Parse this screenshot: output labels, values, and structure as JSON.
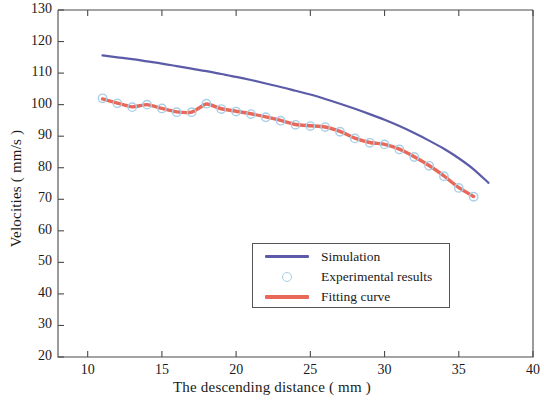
{
  "chart_data": {
    "type": "line",
    "title": "",
    "xlabel": "The descending distance ( mm )",
    "ylabel": "Velocities ( mm/s )",
    "xlim": [
      8,
      40
    ],
    "ylim": [
      20,
      130
    ],
    "xticks": [
      10,
      15,
      20,
      25,
      30,
      35,
      40
    ],
    "yticks": [
      20,
      30,
      40,
      50,
      60,
      70,
      80,
      90,
      100,
      110,
      120,
      130
    ],
    "grid": false,
    "legend_position": "lower-center-right",
    "series": [
      {
        "name": "Simulation",
        "style": "line",
        "color": "#5b5ba8",
        "x": [
          11.0,
          12.0,
          13.0,
          14.0,
          15.0,
          16.0,
          17.0,
          18.0,
          19.0,
          20.0,
          21.0,
          22.0,
          23.0,
          24.0,
          25.0,
          26.0,
          27.0,
          28.0,
          29.0,
          30.0,
          31.0,
          32.0,
          33.0,
          34.0,
          35.0,
          36.0,
          37.0
        ],
        "y": [
          115.6,
          115.0,
          114.4,
          113.7,
          113.0,
          112.2,
          111.4,
          110.6,
          109.7,
          108.8,
          107.8,
          106.7,
          105.6,
          104.4,
          103.2,
          101.8,
          100.3,
          98.7,
          97.0,
          95.2,
          93.2,
          91.0,
          88.6,
          86.0,
          83.0,
          79.5,
          75.2
        ]
      },
      {
        "name": "Experimental results",
        "style": "marker",
        "color": "#a8cfe6",
        "marker": "circle-open",
        "x": [
          11,
          12,
          13,
          14,
          15,
          16,
          17,
          18,
          19,
          20,
          21,
          22,
          23,
          24,
          25,
          26,
          27,
          28,
          29,
          30,
          31,
          32,
          33,
          34,
          35,
          36
        ],
        "y": [
          102.0,
          100.4,
          99.2,
          100.0,
          98.8,
          97.6,
          97.6,
          100.3,
          98.6,
          97.8,
          97.0,
          96.0,
          94.9,
          93.6,
          93.2,
          92.9,
          91.4,
          89.3,
          87.9,
          87.4,
          85.8,
          83.4,
          80.6,
          77.3,
          73.6,
          70.8
        ]
      },
      {
        "name": "Fitting curve",
        "style": "line",
        "color": "#e8685a",
        "x": [
          11,
          12,
          13,
          14,
          15,
          16,
          17,
          18,
          19,
          20,
          21,
          22,
          23,
          24,
          25,
          26,
          27,
          28,
          29,
          30,
          31,
          32,
          33,
          34,
          35,
          36
        ],
        "y": [
          101.8,
          100.5,
          99.3,
          100.0,
          98.8,
          97.7,
          97.6,
          100.2,
          98.7,
          97.9,
          97.1,
          96.1,
          95.0,
          93.7,
          93.3,
          92.9,
          91.5,
          89.4,
          88.0,
          87.4,
          85.9,
          83.5,
          80.7,
          77.4,
          73.7,
          70.9
        ]
      }
    ]
  },
  "legend": {
    "items": [
      {
        "label": "Simulation",
        "key": "line",
        "color": "#5b5ba8"
      },
      {
        "label": "Experimental results",
        "key": "marker",
        "color": "#a8cfe6"
      },
      {
        "label": "Fitting curve",
        "key": "line",
        "color": "#e8685a"
      }
    ]
  },
  "axes": {
    "x_tick_labels": [
      "10",
      "15",
      "20",
      "25",
      "30",
      "35",
      "40"
    ],
    "y_tick_labels": [
      "20",
      "30",
      "40",
      "50",
      "60",
      "70",
      "80",
      "90",
      "100",
      "110",
      "120",
      "130"
    ],
    "xlabel": "The descending distance ( mm )",
    "ylabel": "Velocities ( mm/s )"
  }
}
